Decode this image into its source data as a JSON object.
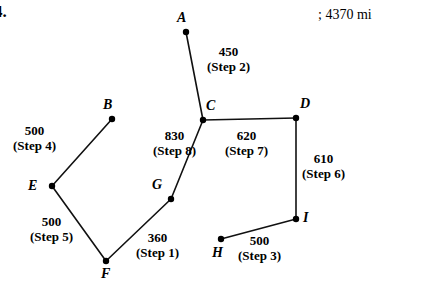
{
  "problem": {
    "number": "4.",
    "answer": "; 4370 mi"
  },
  "graph": {
    "nodes": [
      {
        "id": "A",
        "label": "A",
        "x": 186,
        "y": 32,
        "label_x": 177,
        "label_y": 10
      },
      {
        "id": "B",
        "label": "B",
        "x": 112,
        "y": 119,
        "label_x": 103,
        "label_y": 97
      },
      {
        "id": "C",
        "label": "C",
        "x": 203,
        "y": 120,
        "label_x": 206,
        "label_y": 98
      },
      {
        "id": "D",
        "label": "D",
        "x": 296,
        "y": 118,
        "label_x": 300,
        "label_y": 96
      },
      {
        "id": "E",
        "label": "E",
        "x": 52,
        "y": 186,
        "label_x": 28,
        "label_y": 178
      },
      {
        "id": "F",
        "label": "F",
        "x": 106,
        "y": 261,
        "label_x": 101,
        "label_y": 266
      },
      {
        "id": "G",
        "label": "G",
        "x": 171,
        "y": 199,
        "label_x": 152,
        "label_y": 177
      },
      {
        "id": "H",
        "label": "H",
        "x": 221,
        "y": 239,
        "label_x": 212,
        "label_y": 245
      },
      {
        "id": "I",
        "label": "I",
        "x": 296,
        "y": 219,
        "label_x": 303,
        "label_y": 210
      }
    ],
    "edges": [
      {
        "from": "A",
        "to": "C",
        "weight": "450",
        "step": "(Step 2)",
        "label_x": 207,
        "label_y": 44
      },
      {
        "from": "C",
        "to": "D",
        "weight": "620",
        "step": "(Step 7)",
        "label_x": 225,
        "label_y": 128
      },
      {
        "from": "D",
        "to": "I",
        "weight": "610",
        "step": "(Step 6)",
        "label_x": 302,
        "label_y": 151
      },
      {
        "from": "I",
        "to": "H",
        "weight": "500",
        "step": "(Step 3)",
        "label_x": 238,
        "label_y": 233
      },
      {
        "from": "B",
        "to": "E",
        "weight": "500",
        "step": "(Step 4)",
        "label_x": 13,
        "label_y": 123
      },
      {
        "from": "E",
        "to": "F",
        "weight": "500",
        "step": "(Step 5)",
        "label_x": 30,
        "label_y": 214
      },
      {
        "from": "F",
        "to": "G",
        "weight": "360",
        "step": "(Step 1)",
        "label_x": 136,
        "label_y": 230
      },
      {
        "from": "G",
        "to": "C",
        "weight": "830",
        "step": "(Step 8)",
        "label_x": 153,
        "label_y": 128
      }
    ],
    "node_radius": 3.2,
    "edge_color": "#111111",
    "node_color": "#000000",
    "edge_width": 1.6
  }
}
